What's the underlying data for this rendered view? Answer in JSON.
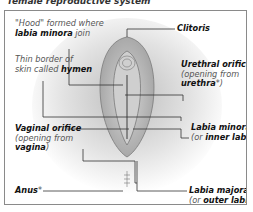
{
  "caption": "female reproductive system",
  "diagram": {
    "type": "labeled anatomical illustration",
    "labels": [
      {
        "id": "hood",
        "line1": "\"Hood\" formed where",
        "bold": "labia minora",
        "after": " join",
        "side": "left"
      },
      {
        "id": "hymen",
        "line1": "Thin border of",
        "line2_pre": "skin called ",
        "bold": "hymen",
        "side": "left"
      },
      {
        "id": "vaginal-orifice",
        "title": "Vaginal orifice",
        "sub": "(opening from",
        "bold": "vagina",
        "after": ")",
        "side": "left"
      },
      {
        "id": "anus",
        "title": "Anus",
        "mark": "*",
        "side": "left"
      },
      {
        "id": "clitoris",
        "title": "Clitoris",
        "side": "right"
      },
      {
        "id": "urethral-orifice",
        "title": "Urethral orifice",
        "sub": "(opening from",
        "bold": "urethra",
        "after": "*)",
        "side": "right"
      },
      {
        "id": "labia-minora",
        "title": "Labia minora",
        "pre": "(or ",
        "bold": "inner labia",
        "after": ")",
        "side": "right"
      },
      {
        "id": "labia-majora",
        "title": "Labia majora",
        "pre": "(or ",
        "bold": "outer labia",
        "after": ")",
        "side": "right"
      }
    ]
  },
  "colors": {
    "frame_border": "#8a8a8a",
    "leader_line": "#333333",
    "shading": "#c9c9c9",
    "text": "#1a1a1a",
    "muted_text": "#555555"
  }
}
